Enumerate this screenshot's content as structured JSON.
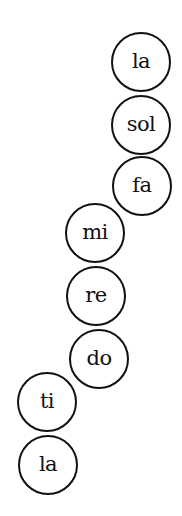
{
  "diagram": {
    "title": "",
    "notes": [
      {
        "label": "la",
        "cx": 140,
        "cy": 61
      },
      {
        "label": "sol",
        "cx": 140,
        "cy": 124
      },
      {
        "label": "fa",
        "cx": 141,
        "cy": 185
      },
      {
        "label": "mi",
        "cx": 94,
        "cy": 232
      },
      {
        "label": "re",
        "cx": 95,
        "cy": 295
      },
      {
        "label": "do",
        "cx": 98,
        "cy": 358
      },
      {
        "label": "ti",
        "cx": 46,
        "cy": 401
      },
      {
        "label": "la",
        "cx": 47,
        "cy": 464
      }
    ],
    "stroke_color": "#111111",
    "background_color": "#ffffff"
  }
}
